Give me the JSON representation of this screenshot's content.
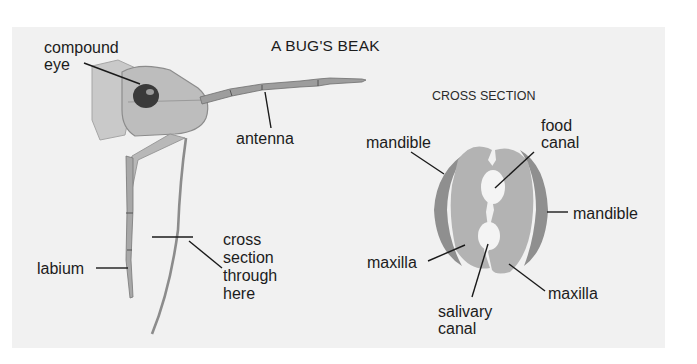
{
  "title": "A BUG'S BEAK",
  "cross_section_title": "CROSS SECTION",
  "labels": {
    "compound_eye": "compound\neye",
    "antenna": "antenna",
    "labium": "labium",
    "cross_section_note": "cross\nsection\nthrough\nhere",
    "mandible_left": "mandible",
    "food_canal": "food\ncanal",
    "mandible_right": "mandible",
    "maxilla_left": "maxilla",
    "maxilla_right": "maxilla",
    "salivary_canal": "salivary\ncanal"
  },
  "colors": {
    "background": "#ffffff",
    "panel": "#f1f1f1",
    "mandible_fill": "#8f8f8f",
    "maxilla_fill": "#b3b3b3",
    "canal_fill": "#f4f4f4",
    "leader_line": "#1a1a1a"
  }
}
